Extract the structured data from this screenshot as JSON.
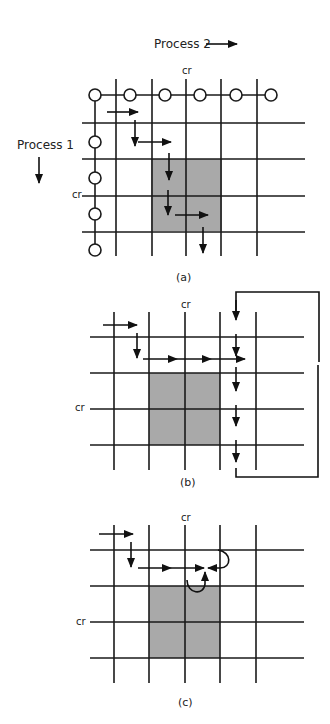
{
  "labels": {
    "process2": "Process 2",
    "process1": "Process 1",
    "cr": "cr",
    "panel_a": "(a)",
    "panel_b": "(b)",
    "panel_c": "(c)"
  },
  "colors": {
    "shade": "#a9a9a9",
    "line": "#1a1a1a",
    "background": "#ffffff"
  },
  "panels": [
    {
      "id": "a",
      "caption": "(a)",
      "description": "Process-graph grid with process state nodes along the axes; a path of arrows moves right and down through the grid, passing through the shaded critical-region rectangle.",
      "grid_columns": 5,
      "grid_rows": 4,
      "process2_nodes": 6,
      "process1_nodes": 5,
      "shaded_region": "2x2 cells at critical-region intersection (cr)"
    },
    {
      "id": "b",
      "caption": "(b)",
      "description": "Path runs right across the top of the shaded region, then drops down the column to the right with a feedback loop from bottom back to top."
    },
    {
      "id": "c",
      "caption": "(c)",
      "description": "Deadlock: path arrows meet at one point from left, right and below with curved arrows, adjacent to the shaded region."
    }
  ]
}
